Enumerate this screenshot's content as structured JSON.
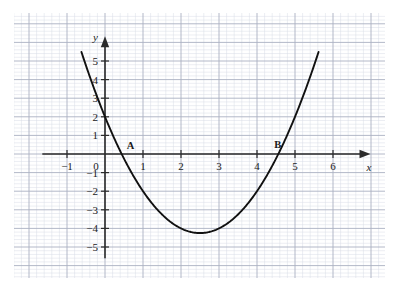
{
  "chart_data": {
    "type": "line",
    "title": "",
    "subtitle": "",
    "xlabel": "x",
    "ylabel": "y",
    "xlim": [
      -1.8,
      7.0
    ],
    "ylim": [
      -5.9,
      6.2
    ],
    "grid": true,
    "grid_minor_step": 0.2,
    "grid_major_step": 1,
    "legend": "none",
    "x_ticks": [
      -1,
      0,
      1,
      2,
      3,
      4,
      5,
      6
    ],
    "x_tick_labels": [
      "−1",
      "0",
      "1",
      "2",
      "3",
      "4",
      "5",
      "6"
    ],
    "y_ticks": [
      -5,
      -4,
      -3,
      -2,
      -1,
      1,
      2,
      3,
      4,
      5
    ],
    "y_tick_labels": [
      "−5",
      "−4",
      "−3",
      "−2",
      "−1",
      "1",
      "2",
      "3",
      "4",
      "5"
    ],
    "series": [
      {
        "name": "parabola",
        "equation": "y = x^2 - 5x + 2",
        "color": "#111111",
        "x_start": -0.62,
        "x_end": 5.62,
        "coefficients": {
          "a": 1,
          "b": -5,
          "c": 2
        },
        "vertex": {
          "x": 2.5,
          "y": -4.25
        },
        "y_intercept": 2,
        "roots": [
          0.44,
          4.56
        ]
      }
    ],
    "annotations": [
      {
        "label": "A",
        "x": 0.44,
        "y": 0,
        "role": "left-root-label"
      },
      {
        "label": "B",
        "x": 4.56,
        "y": 0,
        "role": "right-root-label"
      }
    ]
  },
  "axes": {
    "x_axis_name": "x",
    "y_axis_name": "y"
  },
  "colors": {
    "curve": "#111111",
    "axis": "#2b2b2b",
    "grid_minor": "#d9dce6",
    "grid_major": "#aab0c2",
    "text": "#1a1a1a",
    "background": "#ffffff"
  }
}
